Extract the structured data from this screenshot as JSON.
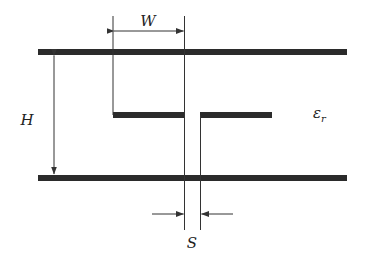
{
  "diagram": {
    "type": "coplanar strips / stripline cross-section",
    "labels": {
      "width": "W",
      "height": "H",
      "spacing": "S",
      "permittivity": "ε",
      "permittivity_sub": "r"
    },
    "colors": {
      "conductor": "#2b2b2b",
      "line": "#333333",
      "background": "#ffffff"
    }
  }
}
